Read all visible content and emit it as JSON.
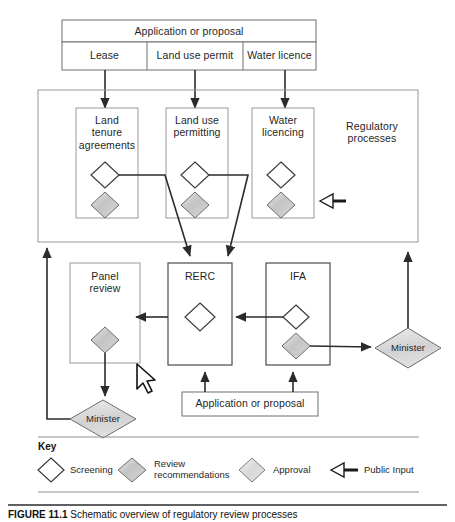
{
  "figure": {
    "caption_bold": "FIGURE 11.1",
    "caption_rest": " Schematic overview of regulatory review processes"
  },
  "diagram": {
    "type": "flowchart",
    "top_header": "Application or proposal",
    "top_categories": [
      "Lease",
      "Land use permit",
      "Water licence"
    ],
    "regulatory_container_label": "Regulatory processes",
    "regulatory_boxes": [
      {
        "label": "Land tenure agreements",
        "lines": [
          "Land",
          "tenure",
          "agreements"
        ],
        "shapes": [
          "screening",
          "review"
        ]
      },
      {
        "label": "Land use permitting",
        "lines": [
          "Land use",
          "permitting"
        ],
        "shapes": [
          "screening",
          "review"
        ]
      },
      {
        "label": "Water licencing",
        "lines": [
          "Water",
          "licencing"
        ],
        "shapes": [
          "screening",
          "review"
        ]
      }
    ],
    "review_boxes": [
      {
        "label": "Panel review",
        "lines": [
          "Panel",
          "review"
        ],
        "shapes": [
          "review"
        ]
      },
      {
        "label": "RERC",
        "lines": [
          "RERC"
        ],
        "shapes": [
          "screening"
        ]
      },
      {
        "label": "IFA",
        "lines": [
          "IFA"
        ],
        "shapes": [
          "screening",
          "review"
        ]
      }
    ],
    "minister_nodes": [
      "Minister",
      "Minister"
    ],
    "bottom_input": "Application or proposal",
    "public_input_marker": "Public Input"
  },
  "key": {
    "title": "Key",
    "items": [
      {
        "symbol": "screening-diamond",
        "label": "Screening",
        "lines": [
          "Screening"
        ]
      },
      {
        "symbol": "review-diamond",
        "label": "Review recommendations",
        "lines": [
          "Review",
          "recommendations"
        ]
      },
      {
        "symbol": "approval-diamond",
        "label": "Approval",
        "lines": [
          "Approval"
        ]
      },
      {
        "symbol": "public-input-arrow",
        "label": "Public Input",
        "lines": [
          "Public Input"
        ]
      }
    ]
  },
  "colors": {
    "stroke": "#3a3a3a",
    "box_stroke": "#8a8a8a",
    "screening_fill": "#ffffff",
    "review_fill": "#c9c9c9",
    "approval_fill": "#dcdcdc",
    "text": "#1f1f1f"
  }
}
